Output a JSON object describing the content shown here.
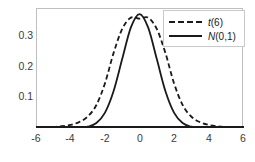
{
  "chart_data": {
    "type": "line",
    "title": "",
    "xlabel": "",
    "ylabel": "",
    "xlim": [
      -6,
      6
    ],
    "ylim": [
      0,
      0.42
    ],
    "grid": false,
    "legend_position": "top-right",
    "xticks": [
      "-6",
      "-4",
      "-2",
      "0",
      "2",
      "4",
      "6"
    ],
    "xtick_values": [
      -6,
      -4,
      -2,
      0,
      2,
      4,
      6
    ],
    "yticks": [
      "0.1",
      "0.2",
      "0.3"
    ],
    "ytick_values": [
      0.1,
      0.2,
      0.3
    ],
    "series": [
      {
        "name": "t(6)",
        "symbol": "t",
        "arg": "(6)",
        "style": "dashed",
        "color": "#1a1a1a",
        "x": [
          -6,
          -5.5,
          -5,
          -4.5,
          -4,
          -3.5,
          -3,
          -2.5,
          -2,
          -1.5,
          -1,
          -0.5,
          0,
          0.5,
          1,
          1.5,
          2,
          2.5,
          3,
          3.5,
          4,
          4.5,
          5,
          5.5,
          6
        ],
        "values": [
          0.0013,
          0.0021,
          0.0035,
          0.0061,
          0.011,
          0.0206,
          0.0402,
          0.0805,
          0.1568,
          0.263,
          0.3469,
          0.3864,
          0.3827,
          0.3864,
          0.3469,
          0.263,
          0.1568,
          0.0805,
          0.0402,
          0.0206,
          0.011,
          0.0061,
          0.0035,
          0.0021,
          0.0013
        ]
      },
      {
        "name": "N(0,1)",
        "symbol": "N",
        "arg": "(0,1)",
        "style": "solid",
        "color": "#1a1a1a",
        "x": [
          -6,
          -5.5,
          -5,
          -4.5,
          -4,
          -3.5,
          -3,
          -2.5,
          -2,
          -1.5,
          -1,
          -0.5,
          0,
          0.5,
          1,
          1.5,
          2,
          2.5,
          3,
          3.5,
          4,
          4.5,
          5,
          5.5,
          6
        ],
        "values": [
          0.0,
          0.0,
          0.0,
          0.0,
          0.0001,
          0.0009,
          0.0044,
          0.0175,
          0.054,
          0.1295,
          0.242,
          0.3521,
          0.3989,
          0.3521,
          0.242,
          0.1295,
          0.054,
          0.0175,
          0.0044,
          0.0009,
          0.0001,
          0.0,
          0.0,
          0.0,
          0.0
        ]
      }
    ]
  },
  "legend": {
    "entries": [
      {
        "label": "t(6)",
        "symbol": "t",
        "arg": "(6)",
        "key": "dashed-line-key"
      },
      {
        "label": "N(0,1)",
        "symbol": "N",
        "arg": "(0,1)",
        "key": "solid-line-key"
      }
    ]
  },
  "axes": {
    "y_labels": [
      "0.3",
      "0.2",
      "0.1"
    ],
    "x_labels": [
      "-6",
      "-4",
      "-2",
      "0",
      "2",
      "4",
      "6"
    ]
  }
}
